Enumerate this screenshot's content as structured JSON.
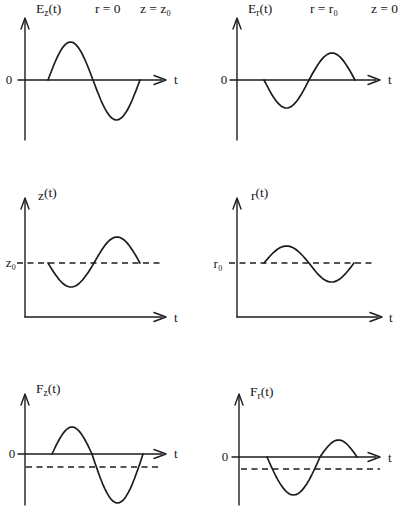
{
  "figure": {
    "background": "#ffffff",
    "ink": "#1d1d1d"
  },
  "chart_data": [
    {
      "type": "line",
      "panel": "top-left",
      "title": "Ez(t)",
      "title_parts": {
        "base": "E",
        "sub": "z",
        "rest": "(t)"
      },
      "conditions": [
        "r = 0",
        "z = z₀"
      ],
      "xlabel": "t",
      "ylabel": "0",
      "dashed_reference": null,
      "waveform": "one sine cycle starting at zero: positive half-lobe then equal negative half-lobe, returning to zero",
      "wave": {
        "x_start": 48,
        "x_cross": 93,
        "x_end": 140,
        "amp1": 38,
        "amp2": -40,
        "baseline_y": 80
      }
    },
    {
      "type": "line",
      "panel": "top-right",
      "title": "Er(t)",
      "title_parts": {
        "base": "E",
        "sub": "r",
        "rest": "(t)"
      },
      "conditions": [
        "r = r₀",
        "z = 0"
      ],
      "xlabel": "t",
      "ylabel": "0",
      "dashed_reference": null,
      "waveform": "inverted sine cycle of smaller amplitude: negative half-lobe then positive half-lobe",
      "wave": {
        "x_start": 264,
        "x_cross": 309,
        "x_end": 355,
        "amp1": -28,
        "amp2": 27,
        "baseline_y": 80
      }
    },
    {
      "type": "line",
      "panel": "middle-left",
      "title": "z(t)",
      "title_parts": {
        "base": "z",
        "sub": "",
        "rest": "(t)"
      },
      "conditions": [],
      "xlabel": "t",
      "ylabel": "z₀",
      "dashed_reference": "horizontal dashed line at equilibrium level z₀",
      "waveform": "oscillation about z₀: dips below dashed level then rises above, returning to z₀",
      "wave": {
        "x_start": 48,
        "x_cross": 94,
        "x_end": 140,
        "amp1": -24,
        "amp2": 26,
        "baseline_y": 263
      }
    },
    {
      "type": "line",
      "panel": "middle-right",
      "title": "r(t)",
      "title_parts": {
        "base": "r",
        "sub": "",
        "rest": "(t)"
      },
      "conditions": [],
      "xlabel": "t",
      "ylabel": "r₀",
      "dashed_reference": "horizontal dashed line at equilibrium level r₀",
      "waveform": "small oscillation about r₀: rises above dashed level then dips below, returning to r₀",
      "wave": {
        "x_start": 264,
        "x_cross": 309,
        "x_end": 354,
        "amp1": 17,
        "amp2": -19,
        "baseline_y": 263
      }
    },
    {
      "type": "line",
      "panel": "bottom-left",
      "title": "Fz(t)",
      "title_parts": {
        "base": "F",
        "sub": "z",
        "rest": "(t)"
      },
      "conditions": [],
      "xlabel": "t",
      "ylabel": "0",
      "dashed_reference": "dashed line slightly below the zero axis marking the negative time-averaged force",
      "waveform": "asymmetric cycle: moderate positive lobe followed by a larger, deeper negative lobe crossing the dashed mean level",
      "wave": {
        "x_start": 52,
        "x_cross": 92,
        "x_end": 143,
        "amp1": 27,
        "amp2": -49,
        "baseline_y": 454
      }
    },
    {
      "type": "line",
      "panel": "bottom-right",
      "title": "Fr(t)",
      "title_parts": {
        "base": "F",
        "sub": "r",
        "rest": "(t)"
      },
      "conditions": [],
      "xlabel": "t",
      "ylabel": "0",
      "dashed_reference": "dashed line slightly below the zero axis marking the negative time-averaged force",
      "waveform": "asymmetric cycle: large deep negative lobe first, then a smaller positive lobe",
      "wave": {
        "x_start": 267,
        "x_cross": 320,
        "x_end": 357,
        "amp1": -38,
        "amp2": 17,
        "baseline_y": 457
      }
    }
  ]
}
